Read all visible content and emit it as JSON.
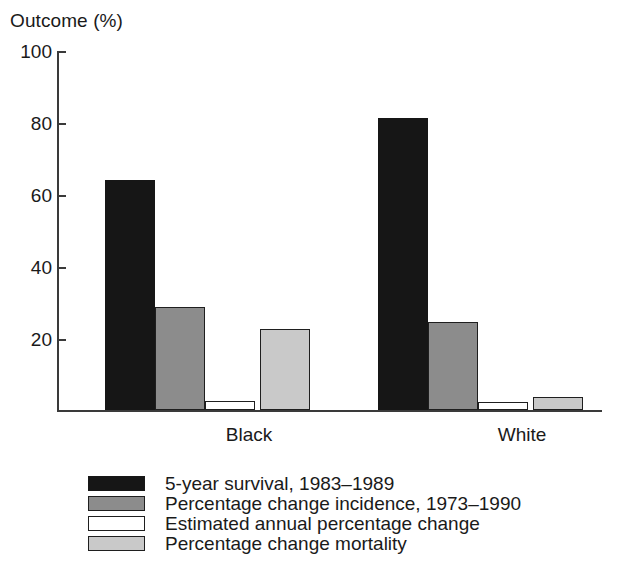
{
  "chart_data": {
    "type": "bar",
    "title": "",
    "ylabel": "Outcome (%)",
    "xlabel": "",
    "ylim": [
      0,
      100
    ],
    "yticks": [
      100,
      80,
      60,
      40,
      20
    ],
    "ytick_labels": [
      "100",
      "80",
      "60",
      "40",
      "20"
    ],
    "grid": false,
    "legend_position": "below",
    "categories": [
      "Black",
      "White"
    ],
    "series": [
      {
        "name": "5-year survival, 1983–1989",
        "color": "#161616",
        "values": [
          64,
          81
        ]
      },
      {
        "name": "Percentage change incidence, 1973–1990",
        "color": "#8c8c8c",
        "values": [
          28.5,
          24.5
        ]
      },
      {
        "name": "Estimated annual percentage change",
        "color": "#ffffff",
        "values": [
          2.5,
          2.2
        ]
      },
      {
        "name": "Percentage change mortality",
        "color": "#c9c9c9",
        "values": [
          22.5,
          3.5
        ]
      }
    ]
  },
  "axis": {
    "y_title": "Outcome (%)"
  },
  "categories": [
    {
      "label": "Black"
    },
    {
      "label": "White"
    }
  ],
  "ticks": [
    {
      "label": "100",
      "value": 100
    },
    {
      "label": "80",
      "value": 80
    },
    {
      "label": "60",
      "value": 60
    },
    {
      "label": "40",
      "value": 40
    },
    {
      "label": "20",
      "value": 20
    }
  ],
  "legend": {
    "items": [
      {
        "label": "5-year survival, 1983–1989",
        "swatch": "black-filled-swatch"
      },
      {
        "label": "Percentage change incidence, 1973–1990",
        "swatch": "gray-filled-swatch"
      },
      {
        "label": "Estimated annual percentage change",
        "swatch": "white-outlined-swatch"
      },
      {
        "label": "Percentage change mortality",
        "swatch": "light-gray-filled-swatch"
      }
    ]
  },
  "colors": {
    "series_0": "#161616",
    "series_1": "#8c8c8c",
    "series_2": "#ffffff",
    "series_3": "#c9c9c9",
    "axis": "#3a3a3a",
    "text": "#1a1a1a",
    "background": "#ffffff"
  }
}
